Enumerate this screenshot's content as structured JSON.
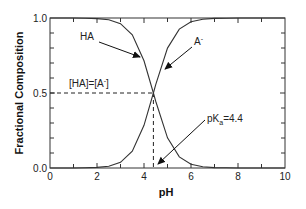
{
  "chart_data": {
    "type": "line",
    "title": "",
    "xlabel": "pH",
    "ylabel": "Fractional Composition",
    "xlim": [
      0,
      10
    ],
    "ylim": [
      0,
      1
    ],
    "grid": false,
    "legend": null,
    "x_ticks": [
      "0",
      "2",
      "4",
      "6",
      "8",
      "10"
    ],
    "y_ticks": [
      "0.0",
      "0.5",
      "1.0"
    ],
    "x": [
      0,
      0.5,
      1,
      1.5,
      2,
      2.5,
      3,
      3.5,
      4,
      4.4,
      4.5,
      5,
      5.5,
      6,
      6.5,
      7,
      7.5,
      8,
      8.5,
      9,
      9.5,
      10
    ],
    "series": [
      {
        "name": "HA",
        "values": [
          1.0,
          1.0,
          1.0,
          0.999,
          0.996,
          0.988,
          0.962,
          0.888,
          0.715,
          0.5,
          0.443,
          0.201,
          0.074,
          0.025,
          0.008,
          0.003,
          0.001,
          0.0,
          0.0,
          0.0,
          0.0,
          0.0
        ]
      },
      {
        "name": "A-",
        "values": [
          0.0,
          0.0,
          0.0,
          0.001,
          0.004,
          0.012,
          0.038,
          0.112,
          0.285,
          0.5,
          0.557,
          0.799,
          0.926,
          0.975,
          0.992,
          0.997,
          0.999,
          1.0,
          1.0,
          1.0,
          1.0,
          1.0
        ]
      }
    ],
    "annotations": [
      {
        "text": "HA",
        "points_to": "HA curve"
      },
      {
        "text": "A-",
        "points_to": "A- curve"
      },
      {
        "text": "[HA]=[A-]",
        "at": [
          4.4,
          0.5
        ]
      },
      {
        "text": "pKa=4.4",
        "points_to": [
          4.4,
          0.0
        ]
      }
    ],
    "reference_lines": [
      {
        "type": "horizontal",
        "y": 0.5,
        "x_range": [
          0,
          4.4
        ],
        "style": "dashed"
      },
      {
        "type": "vertical",
        "x": 4.4,
        "y_range": [
          0,
          0.5
        ],
        "style": "dashed"
      }
    ]
  },
  "labels": {
    "xlabel": "pH",
    "ylabel": "Fractional Composition",
    "ha": "HA",
    "a_minus_base": "A",
    "a_minus_sup": "-",
    "equality_left": "[HA]=[A",
    "equality_sup": "-",
    "equality_right": "]",
    "pka_base": "pK",
    "pka_sub": "a",
    "pka_value": "=4.4",
    "xticks": [
      "0",
      "2",
      "4",
      "6",
      "8",
      "10"
    ],
    "yticks": [
      "0.0",
      "0.5",
      "1.0"
    ]
  }
}
